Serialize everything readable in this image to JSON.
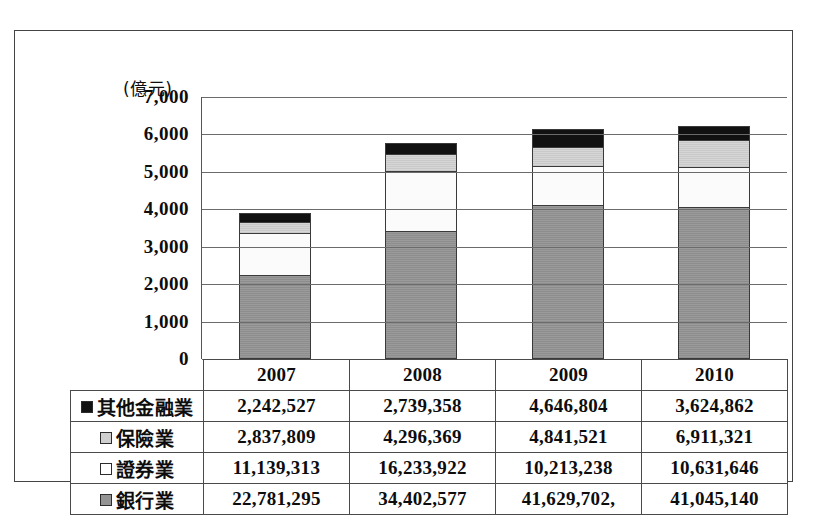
{
  "chart_data": {
    "type": "bar",
    "stacked": true,
    "title": "",
    "subtitle": "",
    "unit_label": "(億元)",
    "xlabel": "",
    "ylabel": "",
    "ylim": [
      0,
      7000
    ],
    "ytick_step": 1000,
    "grid": true,
    "legend_position": "table-left",
    "categories": [
      "2007",
      "2008",
      "2009",
      "2010"
    ],
    "ytick_labels": [
      "7,000",
      "6,000",
      "5,000",
      "4,000",
      "3,000",
      "2,000",
      "1,000",
      "0"
    ],
    "ytick_values": [
      7000,
      6000,
      5000,
      4000,
      3000,
      2000,
      1000,
      0
    ],
    "series": [
      {
        "name": "銀行業",
        "color": "#949494",
        "swatch": "bank",
        "values": [
          2278.1295,
          3440.2577,
          4162.9702,
          4104.514
        ],
        "labels": [
          "22,781,295",
          "34,402,577",
          "41,629,702,",
          "41,045,140"
        ]
      },
      {
        "name": "證券業",
        "color": "#ffffff",
        "swatch": "securities",
        "values": [
          1113.9313,
          1623.3922,
          1021.3238,
          1063.1646
        ],
        "labels": [
          "11,139,313",
          "16,233,922",
          "10,213,238",
          "10,631,646"
        ]
      },
      {
        "name": "保險業",
        "color": "#cfcfcf",
        "swatch": "insurance",
        "values": [
          283.7809,
          429.6369,
          484.1521,
          691.1321
        ],
        "labels": [
          "2,837,809",
          "4,296,369",
          "4,841,521",
          "6,911,321"
        ]
      },
      {
        "name": "其他金融業",
        "color": "#121212",
        "swatch": "other",
        "values": [
          224.2527,
          273.9358,
          464.6804,
          362.4862
        ],
        "labels": [
          "2,242,527",
          "2,739,358",
          "4,646,804",
          "3,624,862"
        ]
      }
    ],
    "totals": [
      3900.0944,
      5767.2226,
      6133.1265,
      6221.2969
    ]
  },
  "table": {
    "corner_label": "",
    "column_headers": [
      "2007",
      "2008",
      "2009",
      "2010"
    ],
    "rows": [
      {
        "swatch": "other",
        "label": "其他金融業",
        "values": [
          "2,242,527",
          "2,739,358",
          "4,646,804",
          "3,624,862"
        ]
      },
      {
        "swatch": "insurance",
        "label": "保險業",
        "values": [
          "2,837,809",
          "4,296,369",
          "4,841,521",
          "6,911,321"
        ]
      },
      {
        "swatch": "securities",
        "label": "證券業",
        "values": [
          "11,139,313",
          "16,233,922",
          "10,213,238",
          "10,631,646"
        ]
      },
      {
        "swatch": "bank",
        "label": "銀行業",
        "values": [
          "22,781,295",
          "34,402,577",
          "41,629,702,",
          "41,045,140"
        ]
      }
    ]
  },
  "colors": {
    "other": "#121212",
    "insurance": "#cfcfcf",
    "securities": "#ffffff",
    "bank": "#949494",
    "grid": "#6b6b6b",
    "border": "#444444",
    "text": "#0d0d0d"
  }
}
